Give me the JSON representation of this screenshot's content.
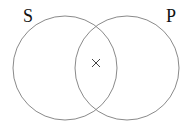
{
  "diagram": {
    "type": "venn",
    "sets": [
      {
        "label": "S",
        "cx": 65,
        "cy": 68,
        "r": 52
      },
      {
        "label": "P",
        "cx": 127,
        "cy": 68,
        "r": 52
      }
    ],
    "marker": {
      "symbol": "×",
      "region": "S∩P",
      "x": 96,
      "y": 63
    },
    "stroke_color": "#888888"
  }
}
